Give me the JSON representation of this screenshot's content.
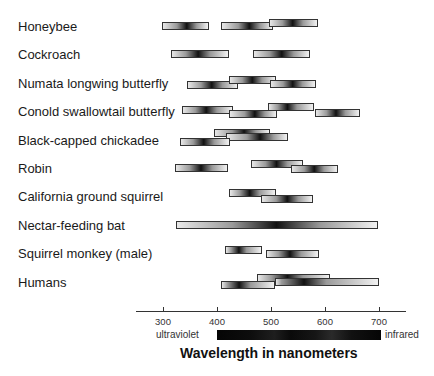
{
  "chart_data": {
    "type": "bar",
    "subtype": "horizontal-range (spectral sensitivity ranges per photoreceptor)",
    "title": "",
    "xlabel": "Wavelength in nanometers",
    "ylabel": "",
    "xlim": [
      250,
      750
    ],
    "xticks": [
      300,
      400,
      500,
      600,
      700
    ],
    "grid": false,
    "legend": null,
    "spectrum_bar": {
      "left_label": "ultraviolet",
      "right_label": "infrared",
      "range": [
        400,
        700
      ]
    },
    "categories": [
      "Honeybee",
      "Cockroach",
      "Numata longwing butterfly",
      "Conold swallowtail butterfly",
      "Black-capped chickadee",
      "Robin",
      "California ground squirrel",
      "Nectar-feeding bat",
      "Squirrel monkey (male)",
      "Humans"
    ],
    "series": [
      {
        "name": "Honeybee",
        "ranges": [
          {
            "start": 298,
            "end": 385,
            "peak": 344,
            "offset": 0
          },
          {
            "start": 407,
            "end": 504,
            "peak": 460,
            "offset": 0
          },
          {
            "start": 496,
            "end": 587,
            "peak": 540,
            "offset": -3
          }
        ]
      },
      {
        "name": "Cockroach",
        "ranges": [
          {
            "start": 315,
            "end": 422,
            "peak": 365,
            "offset": 0
          },
          {
            "start": 467,
            "end": 572,
            "peak": 520,
            "offset": 0
          }
        ]
      },
      {
        "name": "Numata longwing butterfly",
        "ranges": [
          {
            "start": 344,
            "end": 439,
            "peak": 390,
            "offset": 2
          },
          {
            "start": 422,
            "end": 509,
            "peak": 465,
            "offset": -3
          },
          {
            "start": 498,
            "end": 583,
            "peak": 540,
            "offset": 1
          }
        ]
      },
      {
        "name": "Conold swallowtail butterfly",
        "ranges": [
          {
            "start": 335,
            "end": 430,
            "peak": 380,
            "offset": -1
          },
          {
            "start": 422,
            "end": 511,
            "peak": 470,
            "offset": 3
          },
          {
            "start": 494,
            "end": 580,
            "peak": 530,
            "offset": -4
          },
          {
            "start": 581,
            "end": 665,
            "peak": 620,
            "offset": 2
          }
        ]
      },
      {
        "name": "Black-capped chickadee",
        "ranges": [
          {
            "start": 394,
            "end": 498,
            "peak": 450,
            "offset": -7
          },
          {
            "start": 417,
            "end": 531,
            "peak": 480,
            "offset": -3
          },
          {
            "start": 331,
            "end": 424,
            "peak": 375,
            "offset": 2
          }
        ]
      },
      {
        "name": "Robin",
        "ranges": [
          {
            "start": 322,
            "end": 420,
            "peak": 370,
            "offset": 0
          },
          {
            "start": 463,
            "end": 559,
            "peak": 510,
            "offset": -4
          },
          {
            "start": 537,
            "end": 624,
            "peak": 580,
            "offset": 1
          }
        ]
      },
      {
        "name": "California ground squirrel",
        "ranges": [
          {
            "start": 422,
            "end": 509,
            "peak": 460,
            "offset": -3
          },
          {
            "start": 481,
            "end": 578,
            "peak": 530,
            "offset": 3
          }
        ]
      },
      {
        "name": "Nectar-feeding bat",
        "ranges": [
          {
            "start": 324,
            "end": 698,
            "peak": 510,
            "offset": 0
          }
        ]
      },
      {
        "name": "Squirrel monkey (male)",
        "ranges": [
          {
            "start": 415,
            "end": 483,
            "peak": 440,
            "offset": -3
          },
          {
            "start": 491,
            "end": 589,
            "peak": 535,
            "offset": 1
          }
        ]
      },
      {
        "name": "Humans",
        "ranges": [
          {
            "start": 474,
            "end": 609,
            "peak": 530,
            "offset": -4
          },
          {
            "start": 407,
            "end": 507,
            "peak": 440,
            "offset": 3
          },
          {
            "start": 507,
            "end": 700,
            "peak": 560,
            "offset": 0
          }
        ]
      }
    ]
  },
  "layout": {
    "px_per_nm": 0.54,
    "x_origin_nm": 300,
    "x_origin_px": 163,
    "row_top_first": 20,
    "row_spacing": 28.4
  }
}
